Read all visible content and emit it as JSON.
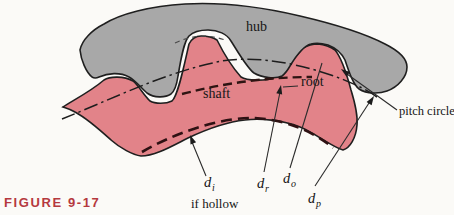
{
  "figure": {
    "caption": "FIGURE 9-17",
    "accent_color": "#b5383e"
  },
  "diagram": {
    "parts": {
      "hub": "hub",
      "shaft": "shaft",
      "root": "root",
      "pitch_circle": "pitch circle",
      "if_hollow": "if hollow"
    },
    "dimensions": {
      "inner": {
        "base": "d",
        "sub": "i"
      },
      "root": {
        "base": "d",
        "sub": "r"
      },
      "outer": {
        "base": "d",
        "sub": "o"
      },
      "pitch": {
        "base": "d",
        "sub": "p"
      }
    },
    "colors": {
      "hub_fill": "#a8a8a8",
      "shaft_fill": "#e28389",
      "root_dash": "#2e1412",
      "inner_dash": "#2e1113",
      "centerline": "#1d1d1d"
    }
  }
}
